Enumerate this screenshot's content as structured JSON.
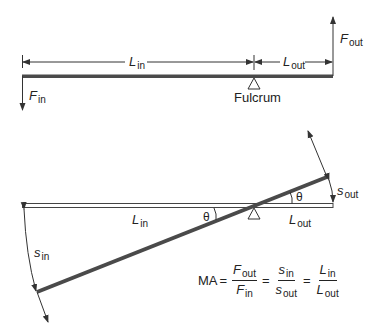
{
  "top_lever": {
    "labels": {
      "L_in": {
        "main": "L",
        "sub": "in"
      },
      "L_out": {
        "main": "L",
        "sub": "out"
      },
      "F_in": {
        "main": "F",
        "sub": "in"
      },
      "F_out": {
        "main": "F",
        "sub": "out"
      },
      "fulcrum": "Fulcrum"
    }
  },
  "bottom_lever": {
    "labels": {
      "L_in": {
        "main": "L",
        "sub": "in"
      },
      "L_out": {
        "main": "L",
        "sub": "out"
      },
      "s_in": {
        "main": "s",
        "sub": "in"
      },
      "s_out": {
        "main": "s",
        "sub": "out"
      },
      "theta_left": "θ",
      "theta_right": "θ"
    }
  },
  "equation": {
    "lhs": "MA",
    "eq": "=",
    "frac1": {
      "num_main": "F",
      "num_sub": "out",
      "den_main": "F",
      "den_sub": "in"
    },
    "frac2": {
      "num_main": "s",
      "num_sub": "in",
      "den_main": "s",
      "den_sub": "out"
    },
    "frac3": {
      "num_main": "L",
      "num_sub": "in",
      "den_main": "L",
      "den_sub": "out"
    }
  },
  "colors": {
    "bar": "#4a4a4a",
    "line": "#333333"
  }
}
